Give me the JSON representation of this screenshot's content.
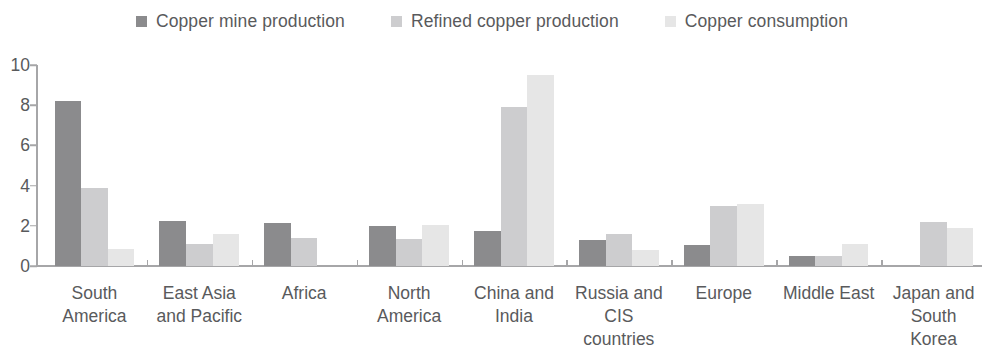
{
  "legend": {
    "items": [
      {
        "label": "Copper mine production",
        "color": "#8b8b8d",
        "swatch_name": "legend-swatch-mine"
      },
      {
        "label": "Refined copper production",
        "color": "#cdcdcf",
        "swatch_name": "legend-swatch-refined"
      },
      {
        "label": "Copper consumption",
        "color": "#e6e6e6",
        "swatch_name": "legend-swatch-consumption"
      }
    ]
  },
  "axis": {
    "y_ticks": [
      "0",
      "2",
      "4",
      "6",
      "8",
      "10"
    ]
  },
  "chart_data": {
    "type": "bar",
    "title": "",
    "subtitle": "",
    "xlabel": "",
    "ylabel": "",
    "ylim": [
      0,
      10
    ],
    "y_ticks": [
      0,
      2,
      4,
      6,
      8,
      10
    ],
    "grid": false,
    "legend_position": "top-center",
    "categories": [
      "South America",
      "East Asia and Pacific",
      "Africa",
      "North America",
      "China and India",
      "Russia and CIS countries",
      "Europe",
      "Middle East",
      "Japan and South Korea"
    ],
    "category_label_lines": [
      [
        "South",
        "America"
      ],
      [
        "East Asia",
        "and Pacific"
      ],
      [
        "Africa"
      ],
      [
        "North",
        "America"
      ],
      [
        "China and",
        "India"
      ],
      [
        "Russia and",
        "CIS",
        "countries"
      ],
      [
        "Europe"
      ],
      [
        "Middle East"
      ],
      [
        "Japan and",
        "South",
        "Korea"
      ]
    ],
    "series": [
      {
        "name": "Copper mine production",
        "color": "#8b8b8d",
        "values": [
          8.2,
          2.25,
          2.15,
          2.0,
          1.75,
          1.3,
          1.05,
          0.5,
          0.0
        ]
      },
      {
        "name": "Refined copper production",
        "color": "#cdcdcf",
        "values": [
          3.9,
          1.1,
          1.4,
          1.35,
          7.9,
          1.6,
          3.0,
          0.5,
          2.2
        ]
      },
      {
        "name": "Copper consumption",
        "color": "#e6e6e6",
        "values": [
          0.85,
          1.6,
          0.0,
          2.05,
          9.5,
          0.8,
          3.1,
          1.1,
          1.9
        ]
      }
    ]
  }
}
